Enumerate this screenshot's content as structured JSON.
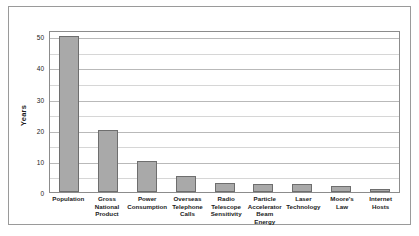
{
  "chart_data": {
    "type": "bar",
    "title": "",
    "xlabel": "",
    "ylabel": "Years",
    "ylim": [
      0,
      52
    ],
    "yticks": [
      0,
      10,
      20,
      30,
      40,
      50
    ],
    "minor_gridlines": [
      5,
      15,
      25,
      35,
      45
    ],
    "grid": true,
    "legend": "none",
    "bar_color": "#a9a9a9",
    "bar_edge_color": "#6e6e6e",
    "categories": [
      "Population",
      "Gross National Product",
      "Power Consumption",
      "Overseas Telephone Calls",
      "Radio Telescope Sensitivity",
      "Particle Accelerator Beam Energy",
      "Laser Technology",
      "Moore's Law",
      "Internet Hosts"
    ],
    "category_lines": [
      [
        "Population"
      ],
      [
        "Gross",
        "National",
        "Product"
      ],
      [
        "Power",
        "Consumption"
      ],
      [
        "Overseas",
        "Telephone",
        "Calls"
      ],
      [
        "Radio",
        "Telescope",
        "Sensitivity"
      ],
      [
        "Particle",
        "Accelerator",
        "Beam Energy"
      ],
      [
        "Laser",
        "Technology"
      ],
      [
        "Moore's",
        "Law"
      ],
      [
        "Internet",
        "Hosts"
      ]
    ],
    "values": [
      50,
      20,
      10,
      5,
      3,
      2.5,
      2.5,
      2,
      1
    ]
  }
}
